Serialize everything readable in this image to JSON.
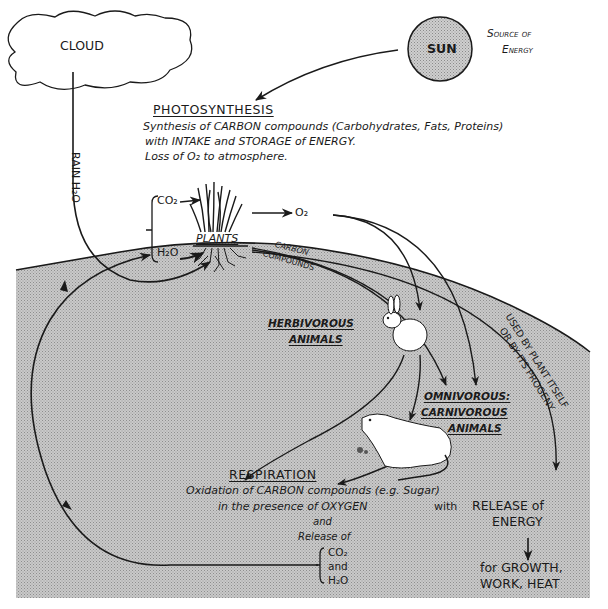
{
  "diagram": {
    "colors": {
      "ink": "#1a1a1a",
      "earth_fill": "#bdbdbd",
      "sun_fill": "#c4c4c4",
      "background": "#ffffff"
    },
    "cloud": {
      "label": "CLOUD"
    },
    "sun": {
      "label": "SUN",
      "caption_line1": "Source of",
      "caption_line2": "Energy"
    },
    "rain": {
      "label": "RAIN H₂O"
    },
    "photosynthesis": {
      "heading": "PHOTOSYNTHESIS",
      "line1": "Synthesis of CARBON compounds (Carbohydrates, Fats, Proteins)",
      "line2": "with INTAKE and STORAGE of ENERGY.",
      "line3": "Loss of O₂ to atmosphere."
    },
    "plants": {
      "label": "PLANTS",
      "input_co2": "CO₂",
      "input_h2o": "H₂O",
      "output_o2": "O₂",
      "carbon_label_1": "CARBON",
      "carbon_label_2": "COMPOUNDS"
    },
    "herbivores": {
      "line1": "HERBIVOROUS",
      "line2": "ANIMALS"
    },
    "carnivores": {
      "line1": "OMNIVOROUS:",
      "line2": "CARNIVOROUS",
      "line3": "ANIMALS"
    },
    "plant_use": {
      "line1": "USED BY PLANT ITSELF",
      "line2": "OR BY ITS PROGENY"
    },
    "respiration": {
      "heading": "RESPIRATION",
      "line1": "Oxidation of CARBON compounds (e.g. Sugar)",
      "line2": "in the presence of OXYGEN",
      "line2_suffix": "with",
      "line3": "and",
      "line4": "Release of",
      "release_1": "CO₂",
      "release_2": "and",
      "release_3": "H₂O"
    },
    "energy": {
      "line1": "RELEASE of",
      "line2": "ENERGY",
      "use1": "for GROWTH,",
      "use2": "WORK, HEAT"
    }
  }
}
